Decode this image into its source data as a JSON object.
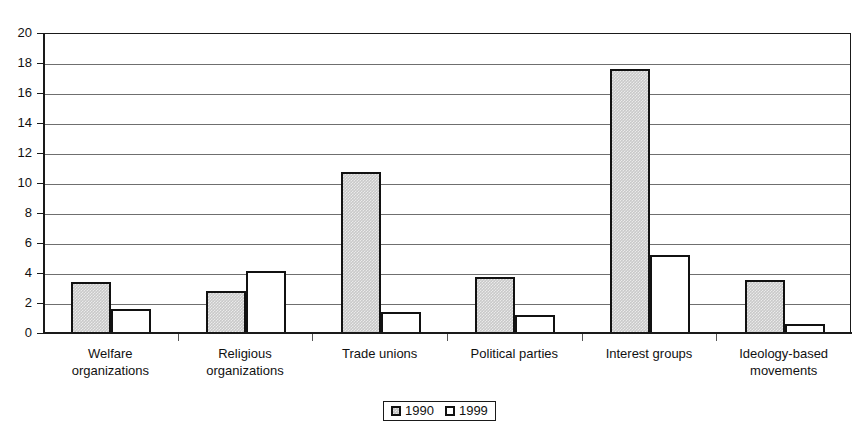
{
  "chart_data": {
    "type": "bar",
    "title": "",
    "xlabel": "",
    "ylabel": "",
    "ylim": [
      0,
      20
    ],
    "yticks": [
      0,
      2,
      4,
      6,
      8,
      10,
      12,
      14,
      16,
      18,
      20
    ],
    "ytick_labels": [
      "0",
      "2",
      "4",
      "6",
      "8",
      "10",
      "12",
      "14",
      "16",
      "18",
      "20"
    ],
    "grid": true,
    "legend_position": "bottom-center",
    "categories": [
      "Welfare\norganizations",
      "Religious\norganizations",
      "Trade unions",
      "Political parties",
      "Interest groups",
      "Ideology-based\nmovements"
    ],
    "series": [
      {
        "name": "1990",
        "color": "#c9c9c9",
        "values": [
          3.5,
          2.9,
          10.8,
          3.8,
          17.7,
          3.6
        ]
      },
      {
        "name": "1999",
        "color": "#ffffff",
        "values": [
          1.7,
          4.2,
          1.5,
          1.3,
          5.3,
          0.7
        ]
      }
    ]
  },
  "legend": {
    "items": [
      {
        "label": "1990",
        "swatch": "gray-filled-square"
      },
      {
        "label": "1999",
        "swatch": "white-square"
      }
    ]
  }
}
